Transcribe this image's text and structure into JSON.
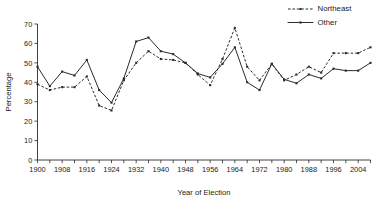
{
  "chart_data": {
    "type": "line",
    "title": "",
    "subtitle": "",
    "xlabel": "Year of Election",
    "ylabel": "Percentage",
    "xlim": [
      1900,
      2008
    ],
    "ylim": [
      0,
      70
    ],
    "ytick_step": 10,
    "xtick_step": 4,
    "xtick_label_step": 8,
    "grid": false,
    "legend_position": "top-right",
    "x": [
      1900,
      1904,
      1908,
      1912,
      1916,
      1920,
      1924,
      1928,
      1932,
      1936,
      1940,
      1944,
      1948,
      1952,
      1956,
      1960,
      1964,
      1968,
      1972,
      1976,
      1980,
      1984,
      1988,
      1992,
      1996,
      2000,
      2004,
      2008
    ],
    "xticklabels": [
      "1900",
      "1908",
      "1916",
      "1924",
      "1932",
      "1940",
      "1948",
      "1956",
      "1964",
      "1972",
      "1980",
      "1988",
      "1996",
      "2004"
    ],
    "yticklabels": [
      "0",
      "10",
      "20",
      "30",
      "40",
      "50",
      "60",
      "70"
    ],
    "series": [
      {
        "name": "Northeast",
        "style": "dashed",
        "marker": "square",
        "color": "#2b2b2b",
        "values": [
          39,
          36,
          37.5,
          37.5,
          43,
          28,
          25.5,
          41,
          50,
          56,
          52,
          51.5,
          50,
          44,
          38.5,
          52,
          68,
          48,
          41,
          49.5,
          41,
          44,
          48,
          45,
          55,
          55,
          55,
          58
        ]
      },
      {
        "name": "Other",
        "style": "solid",
        "marker": "square",
        "color": "#2b2b2b",
        "values": [
          48,
          38,
          45.5,
          43.5,
          51.5,
          36,
          29.5,
          42,
          61,
          63,
          56,
          54.5,
          50,
          44.5,
          42.5,
          49.5,
          58,
          40,
          36,
          49.5,
          41.5,
          39.5,
          44,
          42,
          47,
          46,
          46,
          50
        ]
      }
    ]
  },
  "legend": {
    "entries": [
      {
        "label": "Northeast",
        "style": "dashed"
      },
      {
        "label": "Other",
        "style": "solid"
      }
    ]
  },
  "axes": {
    "x_title": "Year of Election",
    "y_title": "Percentage"
  }
}
